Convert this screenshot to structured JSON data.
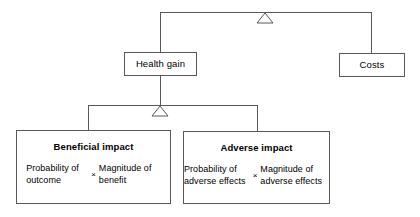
{
  "diagram": {
    "line_color": "#58585a",
    "background": "#ffffff",
    "nodes": {
      "health_gain": {
        "label": "Health gain"
      },
      "costs": {
        "label": "Costs"
      },
      "beneficial": {
        "title": "Beneficial impact",
        "left_term": "Probability of\noutcome",
        "operator": "×",
        "right_term": "Magnitude of\nbenefit"
      },
      "adverse": {
        "title": "Adverse impact",
        "left_term": "Probability of\nadverse effects",
        "operator": "×",
        "right_term": "Magnitude of\nadverse effects"
      }
    },
    "junctions": {
      "top": {
        "symbol": "triangle-outline"
      },
      "middle": {
        "symbol": "triangle-outline"
      }
    }
  }
}
